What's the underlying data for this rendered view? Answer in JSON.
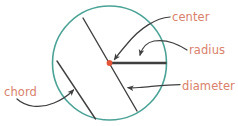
{
  "diagram": {
    "kind": "circle-parts-geometry-diagram",
    "background_color": "#ffffff",
    "circle": {
      "name": "circle-outline",
      "stroke_color": "#4aa396",
      "center_x": 109.5,
      "center_y": 63,
      "radius": 57,
      "stroke_width": 1.6
    },
    "center_point": {
      "name": "center-point",
      "color": "#e4553a",
      "x": 109.5,
      "y": 63,
      "size": 5
    },
    "lines": {
      "stroke_color": "#3f3f3f",
      "radius_line": {
        "x1": 109.5,
        "y1": 63,
        "x2": 166.5,
        "y2": 63,
        "width": 2.4
      },
      "diameter_line": {
        "x1": 83,
        "y1": 18,
        "x2": 137,
        "y2": 111,
        "width": 1.4
      },
      "chord_line": {
        "x1": 57,
        "y1": 61,
        "x2": 95.5,
        "y2": 119,
        "width": 1.4
      }
    },
    "labels": [
      {
        "id": "center",
        "text": "center",
        "color": "#d9816a",
        "x": 172,
        "y": 11
      },
      {
        "id": "radius",
        "text": "radius",
        "color": "#d9816a",
        "x": 189,
        "y": 44
      },
      {
        "id": "diameter",
        "text": "diameter",
        "color": "#d9816a",
        "x": 182,
        "y": 80
      },
      {
        "id": "chord",
        "text": "chord",
        "color": "#d9816a",
        "x": 4,
        "y": 86
      }
    ],
    "cropped_top_text": "",
    "arrows": {
      "stroke_color": "#3f3f3f",
      "items": [
        {
          "id": "center-arrow",
          "from_label": "center",
          "points_to": "center-point"
        },
        {
          "id": "radius-arrow",
          "from_label": "radius",
          "points_to": "radius-line"
        },
        {
          "id": "diameter-arrow",
          "from_label": "diameter",
          "points_to": "diameter-line"
        },
        {
          "id": "chord-arrow",
          "from_label": "chord",
          "points_to": "chord-line"
        }
      ]
    }
  }
}
